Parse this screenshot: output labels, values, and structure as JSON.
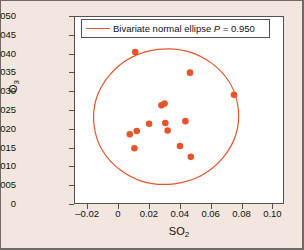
{
  "chart_data": {
    "type": "scatter",
    "title": "",
    "xlabel": "SO2",
    "ylabel": "O3",
    "xlabel_base": "SO",
    "xlabel_sub": "2",
    "ylabel_base": "O",
    "ylabel_sub": "3",
    "xlim": [
      -0.0285,
      0.1075
    ],
    "ylim": [
      0,
      0.05
    ],
    "xticks": [
      -0.02,
      0,
      0.02,
      0.04,
      0.06,
      0.08,
      0.1
    ],
    "xticklabels": [
      "–0.02",
      "0",
      "0.02",
      "0.04",
      "0.06",
      "0.08",
      "0.10"
    ],
    "yticks": [
      0,
      0.005,
      0.01,
      0.015,
      0.02,
      0.025,
      0.03,
      0.035,
      0.04,
      0.045,
      0.05
    ],
    "yticklabels": [
      "0",
      "0.005",
      "0.010",
      "0.015",
      "0.020",
      "0.025",
      "0.030",
      "0.035",
      "0.040",
      "0.045",
      "0.050"
    ],
    "grid": false,
    "marker_color": "#e8542a",
    "ellipse_color": "#e2552a",
    "points": [
      {
        "x": 0.0105,
        "y": 0.0407
      },
      {
        "x": 0.046,
        "y": 0.0352
      },
      {
        "x": 0.0745,
        "y": 0.0293
      },
      {
        "x": 0.0275,
        "y": 0.0265
      },
      {
        "x": 0.0295,
        "y": 0.027
      },
      {
        "x": 0.0195,
        "y": 0.0216
      },
      {
        "x": 0.03,
        "y": 0.0218
      },
      {
        "x": 0.043,
        "y": 0.0223
      },
      {
        "x": 0.0315,
        "y": 0.0198
      },
      {
        "x": 0.007,
        "y": 0.0188
      },
      {
        "x": 0.0115,
        "y": 0.0197
      },
      {
        "x": 0.01,
        "y": 0.0151
      },
      {
        "x": 0.0395,
        "y": 0.0157
      },
      {
        "x": 0.0465,
        "y": 0.0128
      }
    ],
    "ellipse": {
      "label": "Bivariate normal ellipse P = 0.950",
      "label_prefix": "Bivariate normal ellipse ",
      "label_var": "P",
      "label_suffix": " = 0.950",
      "probability": 0.95,
      "center_x": 0.0305,
      "center_y": 0.0235,
      "semi_axis_x": 0.047,
      "semi_axis_y": 0.018,
      "rotation_deg": -7
    }
  },
  "legend": {
    "entries": [
      {
        "text": "Bivariate normal ellipse P = 0.950",
        "prefix": "Bivariate normal ellipse ",
        "variable": "P",
        "suffix": " = 0.950",
        "color": "#e2552a"
      }
    ],
    "position": "top-center-inside"
  },
  "figure": {
    "background": "#f2e6de",
    "plot_background": "#ffffff",
    "border_color": "#55504d"
  }
}
